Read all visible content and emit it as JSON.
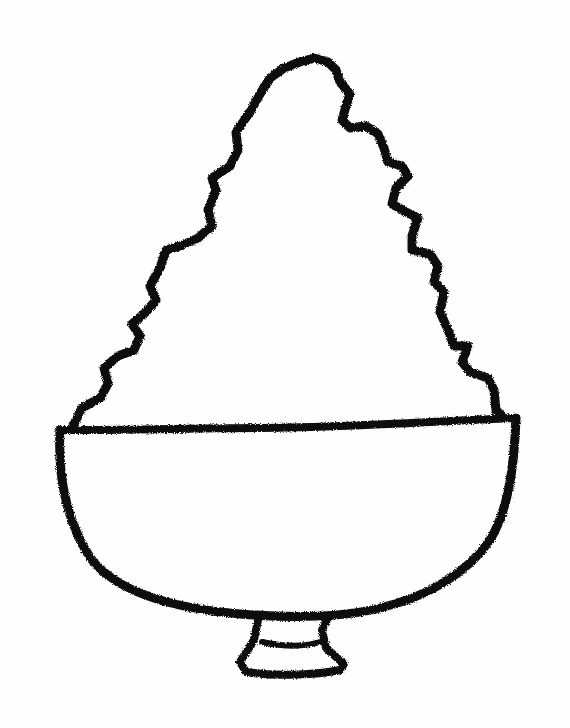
{
  "drawing": {
    "subject": "bowl with heaped mound (shaved ice)",
    "style": "hand-drawn black crayon outline on white paper",
    "colors": {
      "background": "#fefefe",
      "ink": "#111111"
    },
    "parts": [
      {
        "name": "mound",
        "description": "tall wavy, zig-zag triangular mound rising above the bowl"
      },
      {
        "name": "bowl-rim",
        "description": "nearly straight horizontal rim line"
      },
      {
        "name": "bowl-body",
        "description": "rounded U-shaped bowl body"
      },
      {
        "name": "bowl-foot",
        "description": "small trapezoidal pedestal foot under the bowl"
      }
    ]
  }
}
